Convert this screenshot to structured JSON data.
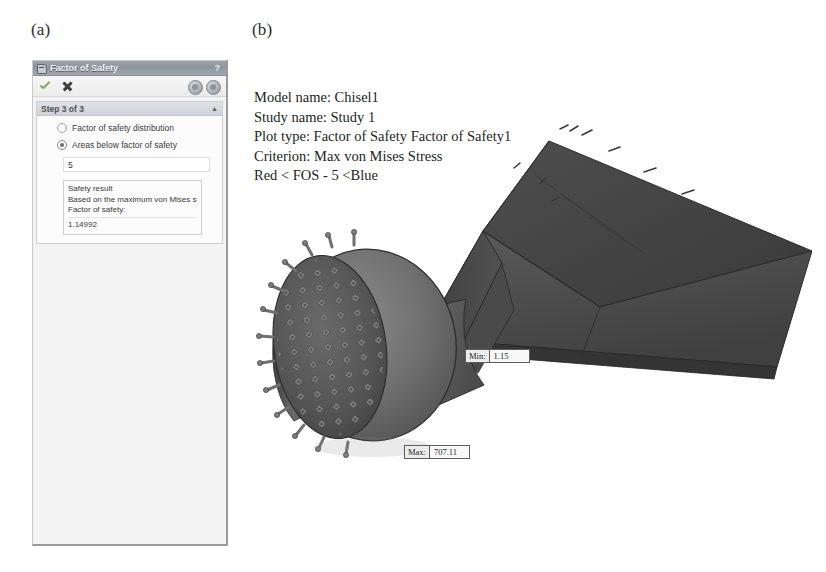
{
  "figure": {
    "panel_a_label": "(a)",
    "panel_b_label": "(b)"
  },
  "fos_panel": {
    "title": "Factor of Safety",
    "help_label": "?",
    "titlebar_icon": "factor-of-safety-icon",
    "toolbar": {
      "accept_icon": "green-check-icon",
      "cancel_icon": "close-x-icon",
      "options_icon": "gear-circle-icon",
      "help_circle_icon": "help-circle-icon"
    },
    "group": {
      "header": "Step 3 of 3",
      "collapse_icon": "chevron-up-icon",
      "options": [
        {
          "label": "Factor of safety distribution",
          "selected": false
        },
        {
          "label": "Areas below factor of safety",
          "selected": true
        }
      ],
      "value_field": {
        "value": "5",
        "placeholder": "5"
      },
      "result": {
        "title": "Safety result",
        "basis": "Based on the maximum von Mises st",
        "factor_label": "Factor of safety:",
        "factor_value": "1.14992"
      }
    }
  },
  "plot": {
    "info_lines": [
      "Model name: Chisel1",
      "Study name: Study 1",
      "Plot type: Factor of Safety Factor of Safety1",
      "Criterion: Max von Mises Stress",
      "Red < FOS - 5 <Blue"
    ],
    "callouts": {
      "min": {
        "key": "Min:",
        "value": "1.15"
      },
      "max": {
        "key": "Max:",
        "value": "707.11"
      }
    },
    "model_name": "studded-drum-chisel-assembly",
    "colors": {
      "body_light": "#8c8c8c",
      "body_mid": "#6e6e6e",
      "body_dark": "#4a4a4a",
      "plate_dark": "#454545",
      "edge": "#2e2e2e"
    }
  }
}
